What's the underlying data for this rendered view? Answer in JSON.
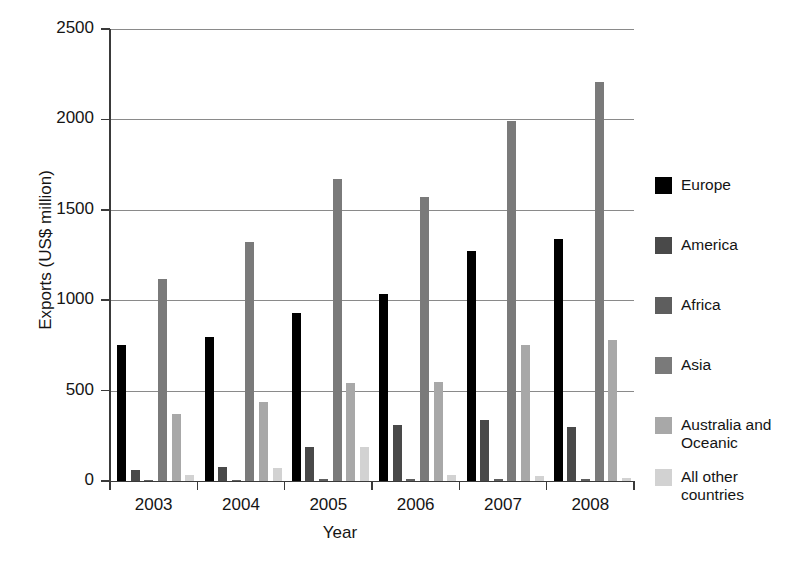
{
  "chart_data": {
    "type": "bar",
    "title": "",
    "subtitle": "",
    "xlabel": "Year",
    "ylabel": "Exports (US$ million)",
    "categories": [
      "2003",
      "2004",
      "2005",
      "2006",
      "2007",
      "2008"
    ],
    "ylim": [
      0,
      2500
    ],
    "yticks": [
      0,
      500,
      1000,
      1500,
      2000,
      2500
    ],
    "ytick_labels": [
      "0",
      "500",
      "1000",
      "1500",
      "2000",
      "2500"
    ],
    "grid": "horizontal",
    "legend_position": "right",
    "orientation": "vertical",
    "grouping": "grouped",
    "series": [
      {
        "name": "Europe",
        "color": "#000000",
        "values": [
          752,
          797,
          929,
          1034,
          1272,
          1339
        ]
      },
      {
        "name": "America",
        "color": "#494949",
        "values": [
          60,
          80,
          190,
          310,
          335,
          300
        ]
      },
      {
        "name": "Africa",
        "color": "#5e5e5e",
        "values": [
          8,
          8,
          10,
          10,
          10,
          10
        ]
      },
      {
        "name": "Asia",
        "color": "#7a7a7a",
        "values": [
          1120,
          1320,
          1670,
          1570,
          1990,
          2205
        ]
      },
      {
        "name": "Australia and\nOceanic",
        "color": "#a8a8a8",
        "values": [
          370,
          435,
          540,
          550,
          750,
          780
        ]
      },
      {
        "name": "All other\ncountries",
        "color": "#d2d2d2",
        "values": [
          35,
          70,
          190,
          35,
          25,
          15
        ]
      }
    ],
    "axis_color": "#3a3a3a",
    "gridline_color": "#8a8a8a",
    "background": "#ffffff"
  }
}
